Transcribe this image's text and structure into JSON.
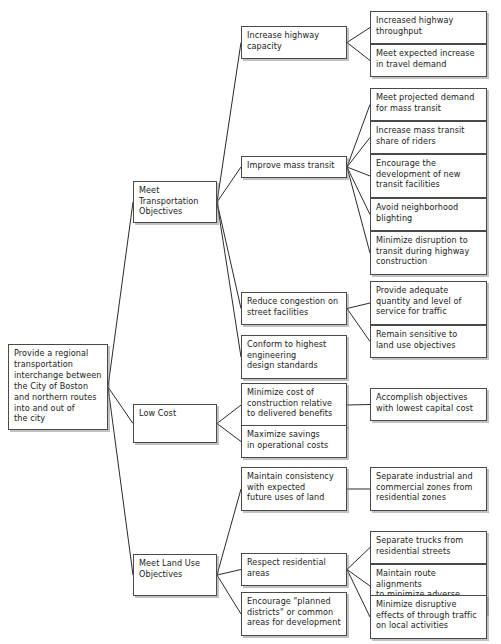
{
  "diagram": {
    "type": "objectives-tree",
    "background_color": "#ffffff",
    "box_border_color": "#4a4a4a",
    "text_color": "#1a1a1a",
    "nodes": [
      {
        "id": "root",
        "label": "Provide a regional\ntransportation\ninterchange between\nthe City of Boston\nand northern routes\ninto and out of\nthe city",
        "level": 0,
        "x": 8,
        "y": 344,
        "w": 100,
        "h": 86
      },
      {
        "id": "l1-transportation",
        "label": "Meet\nTransportation\nObjectives",
        "level": 1,
        "x": 133,
        "y": 181,
        "w": 84,
        "h": 42
      },
      {
        "id": "l1-lowcost",
        "label": "Low Cost",
        "level": 1,
        "x": 133,
        "y": 404,
        "w": 84,
        "h": 39
      },
      {
        "id": "l1-landuse",
        "label": "Meet Land Use\nObjectives",
        "level": 1,
        "x": 133,
        "y": 554,
        "w": 84,
        "h": 42
      },
      {
        "id": "l2-highway-capacity",
        "label": "Increase highway\ncapacity",
        "level": 2,
        "x": 241,
        "y": 26,
        "w": 106,
        "h": 33
      },
      {
        "id": "l2-mass-transit",
        "label": "Improve mass transit",
        "level": 2,
        "x": 241,
        "y": 156,
        "w": 106,
        "h": 22
      },
      {
        "id": "l2-congestion",
        "label": "Reduce congestion on\nstreet facilities",
        "level": 2,
        "x": 241,
        "y": 292,
        "w": 106,
        "h": 33
      },
      {
        "id": "l2-engineering",
        "label": "Conform to highest\nengineering\ndesign standards",
        "level": 2,
        "x": 241,
        "y": 335,
        "w": 106,
        "h": 44
      },
      {
        "id": "l2-min-cost",
        "label": "Minimize cost of\nconstruction relative\nto delivered benefits",
        "level": 2,
        "x": 241,
        "y": 383,
        "w": 106,
        "h": 44
      },
      {
        "id": "l2-max-savings",
        "label": "Maximize savings\nin operational costs",
        "level": 2,
        "x": 241,
        "y": 425,
        "w": 106,
        "h": 33
      },
      {
        "id": "l2-consistency",
        "label": "Maintain consistency\nwith expected\nfuture uses of land",
        "level": 2,
        "x": 241,
        "y": 467,
        "w": 106,
        "h": 44
      },
      {
        "id": "l2-residential",
        "label": "Respect residential\nareas",
        "level": 2,
        "x": 241,
        "y": 553,
        "w": 106,
        "h": 33
      },
      {
        "id": "l2-planned-districts",
        "label": "Encourage \"planned\ndistricts\" or common\nareas for development",
        "level": 2,
        "x": 241,
        "y": 592,
        "w": 106,
        "h": 44
      },
      {
        "id": "l3-throughput",
        "label": "Increased highway\nthroughput",
        "level": 3,
        "x": 370,
        "y": 11,
        "w": 117,
        "h": 33
      },
      {
        "id": "l3-travel-demand",
        "label": "Meet expected increase\nin travel demand",
        "level": 3,
        "x": 370,
        "y": 44,
        "w": 117,
        "h": 33
      },
      {
        "id": "l3-projected-demand",
        "label": "Meet projected demand\nfor mass transit",
        "level": 3,
        "x": 370,
        "y": 88,
        "w": 117,
        "h": 33
      },
      {
        "id": "l3-share-riders",
        "label": "Increase mass transit\nshare of riders",
        "level": 3,
        "x": 370,
        "y": 121,
        "w": 117,
        "h": 33
      },
      {
        "id": "l3-new-facilities",
        "label": "Encourage the\ndevelopment of new\ntransit facilities",
        "level": 3,
        "x": 370,
        "y": 154,
        "w": 117,
        "h": 44
      },
      {
        "id": "l3-blighting",
        "label": "Avoid neighborhood\nblighting",
        "level": 3,
        "x": 370,
        "y": 198,
        "w": 117,
        "h": 33
      },
      {
        "id": "l3-disruption-transit",
        "label": "Minimize disruption to\ntransit during highway\nconstruction",
        "level": 3,
        "x": 370,
        "y": 231,
        "w": 117,
        "h": 44
      },
      {
        "id": "l3-service-traffic",
        "label": "Provide adequate\nquantity and level of\nservice for traffic",
        "level": 3,
        "x": 370,
        "y": 281,
        "w": 117,
        "h": 44
      },
      {
        "id": "l3-land-use-sensitive",
        "label": "Remain sensitive to\nland use objectives",
        "level": 3,
        "x": 370,
        "y": 325,
        "w": 117,
        "h": 33
      },
      {
        "id": "l3-lowest-capital",
        "label": "Accomplish objectives\nwith lowest capital cost",
        "level": 3,
        "x": 370,
        "y": 388,
        "w": 117,
        "h": 33
      },
      {
        "id": "l3-separate-zones",
        "label": "Separate industrial and\ncommercial zones from\nresidential zones",
        "level": 3,
        "x": 370,
        "y": 467,
        "w": 117,
        "h": 44
      },
      {
        "id": "l3-separate-trucks",
        "label": "Separate trucks from\nresidential streets",
        "level": 3,
        "x": 370,
        "y": 531,
        "w": 117,
        "h": 33
      },
      {
        "id": "l3-route-alignments",
        "label": "Maintain route alignments\nto minimize adverse\neffects on neighborhoods",
        "level": 3,
        "x": 370,
        "y": 564,
        "w": 117,
        "h": 44
      },
      {
        "id": "l3-through-traffic",
        "label": "Minimize disruptive\neffects of through traffic\non local activities",
        "level": 3,
        "x": 370,
        "y": 595,
        "w": 117,
        "h": 44
      }
    ],
    "edges": [
      {
        "from": "root",
        "to": "l1-transportation"
      },
      {
        "from": "root",
        "to": "l1-lowcost"
      },
      {
        "from": "root",
        "to": "l1-landuse"
      },
      {
        "from": "l1-transportation",
        "to": "l2-highway-capacity"
      },
      {
        "from": "l1-transportation",
        "to": "l2-mass-transit"
      },
      {
        "from": "l1-transportation",
        "to": "l2-congestion"
      },
      {
        "from": "l1-transportation",
        "to": "l2-engineering"
      },
      {
        "from": "l1-lowcost",
        "to": "l2-min-cost"
      },
      {
        "from": "l1-lowcost",
        "to": "l2-max-savings"
      },
      {
        "from": "l1-landuse",
        "to": "l2-consistency"
      },
      {
        "from": "l1-landuse",
        "to": "l2-residential"
      },
      {
        "from": "l1-landuse",
        "to": "l2-planned-districts"
      },
      {
        "from": "l2-highway-capacity",
        "to": "l3-throughput"
      },
      {
        "from": "l2-highway-capacity",
        "to": "l3-travel-demand"
      },
      {
        "from": "l2-mass-transit",
        "to": "l3-projected-demand"
      },
      {
        "from": "l2-mass-transit",
        "to": "l3-share-riders"
      },
      {
        "from": "l2-mass-transit",
        "to": "l3-new-facilities"
      },
      {
        "from": "l2-mass-transit",
        "to": "l3-blighting"
      },
      {
        "from": "l2-mass-transit",
        "to": "l3-disruption-transit"
      },
      {
        "from": "l2-congestion",
        "to": "l3-service-traffic"
      },
      {
        "from": "l2-congestion",
        "to": "l3-land-use-sensitive"
      },
      {
        "from": "l2-min-cost",
        "to": "l3-lowest-capital"
      },
      {
        "from": "l2-consistency",
        "to": "l3-separate-zones"
      },
      {
        "from": "l2-residential",
        "to": "l3-separate-trucks"
      },
      {
        "from": "l2-residential",
        "to": "l3-route-alignments"
      },
      {
        "from": "l2-residential",
        "to": "l3-through-traffic"
      }
    ]
  }
}
